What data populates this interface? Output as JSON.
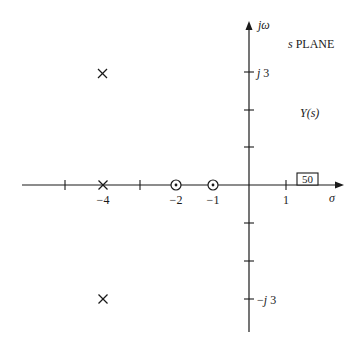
{
  "diagram": {
    "plane_label": "s PLANE",
    "plane_label_s": "s",
    "plane_label_word": "PLANE",
    "function_label": "Y(s)",
    "gain_box": "50",
    "axes": {
      "real_axis_label": "σ",
      "imag_axis_label": "jω"
    },
    "real_tick_labels": {
      "minus4": "−4",
      "minus2": "−2",
      "minus1": "−1",
      "plus1": "1"
    },
    "imag_tick_labels": {
      "plus3": "j 3",
      "minus3": "−j 3"
    },
    "poles": [
      {
        "re": -4,
        "im": 3,
        "symbol": "×"
      },
      {
        "re": -4,
        "im": 0,
        "symbol": "×"
      },
      {
        "re": -4,
        "im": -3,
        "symbol": "×"
      }
    ],
    "zeros": [
      {
        "re": -2,
        "im": 0,
        "symbol": "⊙"
      },
      {
        "re": -1,
        "im": 0,
        "symbol": "⊙"
      }
    ],
    "colors": {
      "ink": "#1a1a1a",
      "background": "#ffffff"
    }
  }
}
